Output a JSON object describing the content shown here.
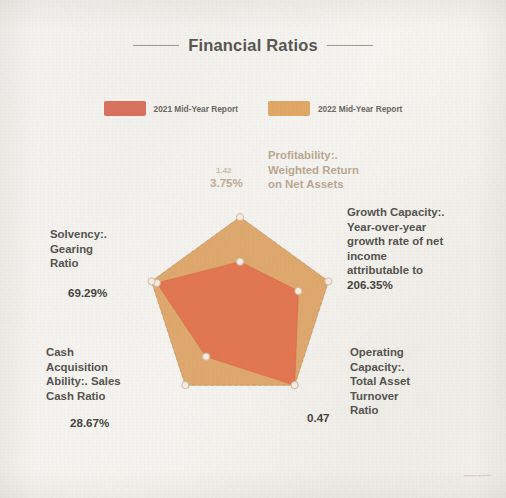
{
  "document": {
    "title": "Financial Ratios",
    "watermark": "——"
  },
  "legend": {
    "position": "top",
    "items": [
      {
        "label": "2021 Mid-Year Report",
        "color": "#d9705e",
        "name": "legend-2021"
      },
      {
        "label": "2022 Mid-Year Report",
        "color": "#e0a765",
        "name": "legend-2022"
      }
    ]
  },
  "chart_data": {
    "type": "radar",
    "title": "Financial Ratios",
    "xlabel": "",
    "ylabel": "",
    "grid": true,
    "legend_position": "top",
    "categories": [
      "Profitability:. Weighted Return on Net Assets",
      "Growth Capacity:. Year-over-year growth rate of net income attributable to",
      "Operating Capacity:. Total Asset Turnover Ratio",
      "Cash Acquisition Ability:. Sales Cash Ratio",
      "Solvency:. Gearing Ratio"
    ],
    "category_short": [
      "Profitability",
      "Growth Capacity",
      "Operating Capacity",
      "Cash Acquisition Ability",
      "Solvency"
    ],
    "value_labels": [
      "3.75%",
      "206.35%",
      "0.47",
      "28.67%",
      "69.29%"
    ],
    "value_labels_secondary": [
      "1.42",
      "",
      "",
      "",
      ""
    ],
    "series": [
      {
        "name": "2021 Mid-Year Report",
        "color": "#d9705e",
        "normalized": [
          0.52,
          0.66,
          1.0,
          0.62,
          0.94
        ]
      },
      {
        "name": "2022 Mid-Year Report",
        "color": "#e0a765",
        "normalized": [
          1.0,
          1.0,
          1.0,
          1.0,
          1.0
        ]
      }
    ],
    "axis_ticks": [
      "1.42",
      "3.75%",
      "206.35%",
      "0.47",
      "28.67%",
      "69.29%"
    ],
    "rings": 1
  },
  "axes": {
    "profitability": {
      "label": "Profitability:.\nWeighted Return\non Net Assets",
      "value": "3.75%",
      "value_secondary": "1.42"
    },
    "growth": {
      "label": "Growth Capacity:.\nYear-over-year\ngrowth rate of net\nincome\nattributable to",
      "value": "206.35%"
    },
    "solvency": {
      "label": "Solvency:.\nGearing\nRatio",
      "value": "69.29%"
    },
    "cash": {
      "label": "Cash\nAcquisition\nAbility:. Sales\nCash Ratio",
      "value": "28.67%"
    },
    "operating": {
      "label": "Operating\nCapacity:.\nTotal Asset\nTurnover\nRatio",
      "value": "0.47"
    }
  }
}
